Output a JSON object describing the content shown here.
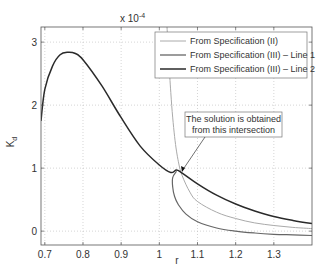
{
  "chart_data": {
    "type": "line",
    "title": "",
    "xlabel": "r",
    "ylabel": "K_d",
    "y_scale_note": "x 10^-4",
    "xlim": [
      0.69,
      1.4
    ],
    "ylim": [
      -0.22,
      3.24
    ],
    "x_ticks": [
      "0.7",
      "0.8",
      "0.9",
      "1",
      "1.1",
      "1.2",
      "1.3"
    ],
    "y_ticks": [
      "0",
      "1",
      "2",
      "3"
    ],
    "grid": true,
    "legend_position": "upper right",
    "series": [
      {
        "name": "From Specification (II)",
        "color": "#aaaaaa",
        "x": [
          1.02,
          1.03,
          1.04,
          1.05,
          1.06,
          1.08,
          1.1,
          1.15,
          1.2,
          1.25,
          1.3,
          1.35,
          1.4
        ],
        "y": [
          3.24,
          2.2,
          1.5,
          1.1,
          0.88,
          0.62,
          0.47,
          0.3,
          0.2,
          0.13,
          0.09,
          0.06,
          0.04
        ]
      },
      {
        "name": "From Specification (III) - Line 1",
        "color": "#666666",
        "x": [
          1.045,
          1.035,
          1.035,
          1.04,
          1.05,
          1.07,
          1.1,
          1.15,
          1.2,
          1.25,
          1.3,
          1.35,
          1.4
        ],
        "y": [
          0.95,
          0.85,
          0.7,
          0.55,
          0.42,
          0.27,
          0.15,
          0.05,
          0.0,
          -0.03,
          -0.05,
          -0.06,
          -0.07
        ]
      },
      {
        "name": "From Specification (III) - Line 2",
        "color": "#2a2a2a",
        "x": [
          0.69,
          0.7,
          0.72,
          0.74,
          0.76,
          0.78,
          0.8,
          0.85,
          0.9,
          0.95,
          1.0,
          1.03,
          1.045,
          1.06,
          1.1,
          1.15,
          1.2,
          1.25,
          1.3,
          1.35,
          1.4
        ],
        "y": [
          1.75,
          2.25,
          2.62,
          2.8,
          2.84,
          2.82,
          2.72,
          2.3,
          1.8,
          1.35,
          1.05,
          0.93,
          0.97,
          0.92,
          0.75,
          0.57,
          0.43,
          0.32,
          0.23,
          0.17,
          0.12
        ]
      }
    ],
    "annotations": [
      {
        "text_lines": [
          "The solution is obtained",
          "from this intersection"
        ],
        "arrow_to": [
          1.05,
          0.93
        ]
      }
    ]
  },
  "legend": {
    "items": [
      "From Specification (II)",
      "From Specification (III) – Line 1",
      "From Specification (III) – Line 2"
    ]
  },
  "annotation": {
    "line1": "The solution is obtained",
    "line2": "from this intersection"
  },
  "axes": {
    "xlabel": "r",
    "ylabel_main": "K",
    "ylabel_sub": "d",
    "scale_base": "x 10",
    "scale_exp": "-4"
  }
}
